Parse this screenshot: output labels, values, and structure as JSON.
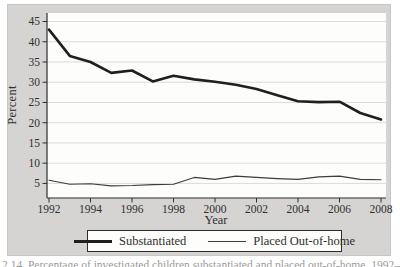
{
  "figure": {
    "caption_partial": "2.14. Percentage of investigated children substantiated and placed out-of-home, 1992–2008"
  },
  "colors": {
    "panel_background": "#d5d4d2",
    "plot_background": "#fdfdfc",
    "gridline": "#dddcda",
    "axis": "#2e2e2e",
    "text": "#2f2f2f",
    "substantiated_line": "#1f1f1f",
    "placed_line": "#3c3c3c"
  },
  "chart_data": {
    "type": "line",
    "title": "",
    "xlabel": "Year",
    "ylabel": "Percent",
    "x": [
      1992,
      1993,
      1994,
      1995,
      1996,
      1997,
      1998,
      1999,
      2000,
      2001,
      2002,
      2003,
      2004,
      2005,
      2006,
      2007,
      2008
    ],
    "series": [
      {
        "name": "Substantiated",
        "values": [
          43.0,
          36.5,
          35.0,
          32.3,
          32.9,
          30.2,
          31.6,
          30.7,
          30.1,
          29.4,
          28.3,
          26.8,
          25.3,
          25.1,
          25.2,
          22.4,
          20.8
        ],
        "color": "#1f1f1f",
        "stroke_width": 2.6
      },
      {
        "name": "Placed Out-of-home",
        "values": [
          5.8,
          4.8,
          4.9,
          4.4,
          4.5,
          4.7,
          4.8,
          6.5,
          6.0,
          6.8,
          6.5,
          6.2,
          6.0,
          6.6,
          6.8,
          6.0,
          5.9
        ],
        "color": "#3c3c3c",
        "stroke_width": 1.1
      }
    ],
    "x_ticks": [
      1992,
      1994,
      1996,
      1998,
      2000,
      2002,
      2004,
      2006,
      2008
    ],
    "y_ticks": [
      5,
      10,
      15,
      20,
      25,
      30,
      35,
      40,
      45
    ],
    "ylim": [
      1.4,
      47.1
    ],
    "grid": "horizontal",
    "legend_position": "bottom"
  },
  "legend": {
    "items": [
      {
        "label": "Substantiated",
        "style": "thick"
      },
      {
        "label": "Placed Out-of-home",
        "style": "thin"
      }
    ]
  }
}
